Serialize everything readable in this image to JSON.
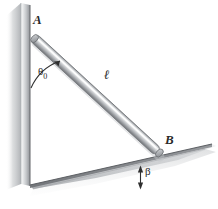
{
  "figure": {
    "background_color": "#ffffff",
    "width": 218,
    "height": 209,
    "labels": {
      "point_a": "A",
      "point_b": "B",
      "rod_length": "ℓ",
      "theta_symbol": "θ",
      "theta_subscript": "0",
      "beta_symbol": "β"
    },
    "colors": {
      "wall_light": "#e2e4e6",
      "wall_mid": "#b9bcbf",
      "wall_dark": "#8d9094",
      "rod_highlight": "#f2f3f4",
      "rod_mid": "#c6c9cc",
      "rod_dark": "#7e8185",
      "ground_light": "#dfe1e3",
      "ground_dark": "#8a8d91",
      "outline": "#6e7175",
      "ink": "#2a2a2a"
    },
    "geometry": {
      "point_a": {
        "x": 33,
        "y": 37
      },
      "point_b": {
        "x": 158,
        "y": 152
      },
      "wall_top": {
        "x": 30,
        "y": 4
      },
      "wall_base": {
        "x": 30,
        "y": 185
      },
      "ground_right": {
        "x": 212,
        "y": 144
      },
      "reference_line_y": 188
    }
  }
}
